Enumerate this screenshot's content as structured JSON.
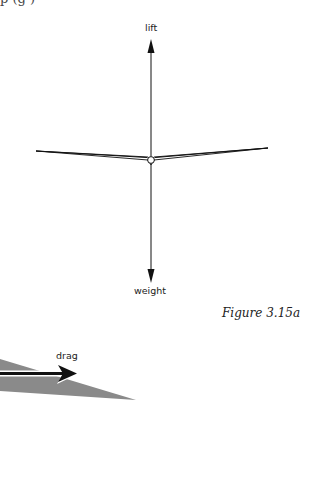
{
  "top_text_fragment": "p  (g          )",
  "figure_a": {
    "forces": {
      "lift": {
        "label": "lift",
        "direction": "up"
      },
      "weight": {
        "label": "weight",
        "direction": "down"
      }
    },
    "caption": "Figure 3.15a"
  },
  "figure_b": {
    "forces": {
      "drag": {
        "label": "drag",
        "direction": "right"
      }
    }
  },
  "colors": {
    "line": "#111111",
    "wedge_fill": "#8a8a8a",
    "background": "#ffffff"
  }
}
